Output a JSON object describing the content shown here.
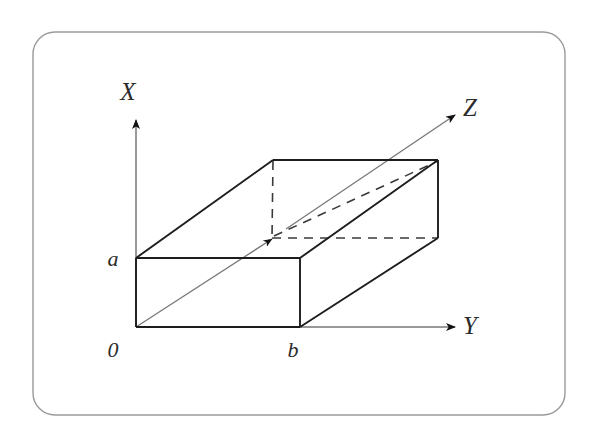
{
  "figure": {
    "background_color": "#ffffff",
    "border": {
      "color": "#9a9a9a",
      "radius_px": 22,
      "stroke_width": 1.4
    },
    "stroke_colors": {
      "solid_edge": "#1d1d1d",
      "dashed_edge": "#3a3a3a",
      "axis": "#6e6e6e",
      "arrow_head": "#111111",
      "z_ray_thin": "#6e6e6e"
    }
  },
  "axes": [
    {
      "id": "x-axis",
      "label": "X",
      "direction": "up",
      "label_position": {
        "x": 128,
        "y": 100
      },
      "origin": {
        "x": 136,
        "y": 327
      },
      "tip": {
        "x": 136,
        "y": 118
      }
    },
    {
      "id": "y-axis",
      "label": "Y",
      "direction": "right",
      "label_position": {
        "x": 470,
        "y": 334
      },
      "origin": {
        "x": 136,
        "y": 327
      },
      "tip": {
        "x": 458,
        "y": 327
      }
    },
    {
      "id": "z-axis",
      "label": "Z",
      "direction": "up-right (oblique)",
      "label_position": {
        "x": 470,
        "y": 116
      },
      "origin": {
        "x": 136,
        "y": 327
      },
      "tip": {
        "x": 459,
        "y": 112
      }
    }
  ],
  "point_labels": [
    {
      "id": "origin-label",
      "text": "0",
      "x": 113,
      "y": 357
    },
    {
      "id": "a-label",
      "text": "a",
      "x": 113,
      "y": 266
    },
    {
      "id": "b-label",
      "text": "b",
      "x": 293,
      "y": 357
    }
  ],
  "box": {
    "name": "rectangular-box",
    "vertices": {
      "front_bottom_left": {
        "x": 136,
        "y": 327
      },
      "front_bottom_right": {
        "x": 300,
        "y": 327
      },
      "front_top_left": {
        "x": 136,
        "y": 258
      },
      "front_top_right": {
        "x": 300,
        "y": 258
      },
      "back_bottom_left": {
        "x": 272,
        "y": 238
      },
      "back_bottom_right": {
        "x": 438,
        "y": 238
      },
      "back_top_left": {
        "x": 273,
        "y": 160
      },
      "back_top_right": {
        "x": 438,
        "y": 160
      }
    },
    "solid_edges": [
      "front_bottom_left-front_bottom_right",
      "front_bottom_left-front_top_left",
      "front_bottom_right-front_top_right",
      "front_top_left-front_top_right",
      "front_top_left-back_top_left",
      "front_top_right-back_top_right",
      "back_top_left-back_top_right",
      "back_top_right-back_bottom_right",
      "front_bottom_right-back_bottom_right"
    ],
    "dashed_edges": [
      "back_top_left-back_bottom_left",
      "back_bottom_left-back_bottom_right",
      "back_bottom_left-front_top_right"
    ]
  }
}
